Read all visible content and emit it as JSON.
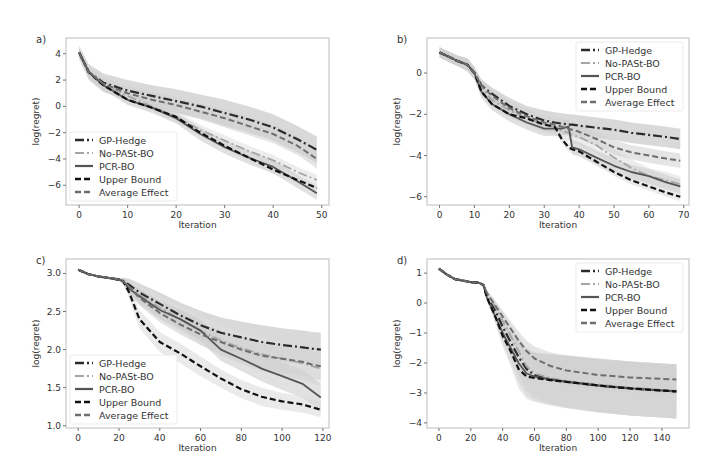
{
  "figure": {
    "background": "#ffffff",
    "frame_color": "#bdbdbd"
  },
  "series_styles": [
    {
      "name": "GP-Hedge",
      "color": "#2b2b2b",
      "dash": "9,3,2,3",
      "width": 2.2,
      "band": "#b9b9b9"
    },
    {
      "name": "No-PASt-BO",
      "color": "#a6a6a6",
      "dash": "9,3,2,3",
      "width": 1.8,
      "band": "#dedede"
    },
    {
      "name": "PCR-BO",
      "color": "#555555",
      "dash": "",
      "width": 1.8,
      "band": "#c8c8c8"
    },
    {
      "name": "Upper Bound",
      "color": "#111111",
      "dash": "6,3",
      "width": 2.2,
      "band": "#d9d9d9"
    },
    {
      "name": "Average Effect",
      "color": "#6e6e6e",
      "dash": "6,3",
      "width": 2.0,
      "band": "#cfcfcf"
    }
  ],
  "chart_data": [
    {
      "panel_label": "a)",
      "type": "line",
      "title": "",
      "xlabel": "Iteration",
      "ylabel": "log(regret)",
      "xlim": [
        -2.7,
        51.5
      ],
      "ylim": [
        -7.5,
        5.2
      ],
      "xticks": [
        0,
        10,
        20,
        30,
        40,
        50
      ],
      "yticks": [
        4,
        2,
        0,
        -2,
        -4,
        -6
      ],
      "grid": false,
      "legend_position": "lower left",
      "box": {
        "x": 66,
        "y": 38,
        "w": 263,
        "h": 167
      },
      "x": [
        0,
        2,
        5,
        10,
        15,
        20,
        25,
        30,
        35,
        40,
        45,
        49
      ],
      "series": [
        {
          "name": "GP-Hedge",
          "values": [
            4.1,
            2.6,
            1.8,
            1.2,
            0.8,
            0.4,
            0.0,
            -0.5,
            -1.0,
            -1.6,
            -2.5,
            -3.3
          ],
          "band": [
            0.5,
            0.6,
            0.7,
            0.8,
            0.8,
            0.9,
            0.9,
            1.0,
            1.0,
            1.0,
            1.0,
            1.0
          ]
        },
        {
          "name": "No-PASt-BO",
          "values": [
            4.1,
            2.6,
            1.7,
            0.8,
            0.0,
            -0.8,
            -1.8,
            -2.6,
            -3.4,
            -4.1,
            -5.0,
            -5.6
          ],
          "band": [
            0.3,
            0.3,
            0.3,
            0.4,
            0.4,
            0.4,
            0.4,
            0.4,
            0.4,
            0.4,
            0.4,
            0.4
          ]
        },
        {
          "name": "PCR-BO",
          "values": [
            4.1,
            2.6,
            1.6,
            0.5,
            -0.1,
            -0.9,
            -2.1,
            -3.1,
            -3.9,
            -4.6,
            -5.7,
            -6.6
          ],
          "band": [
            0.3,
            0.3,
            0.3,
            0.4,
            0.4,
            0.4,
            0.5,
            0.5,
            0.5,
            0.5,
            0.5,
            0.5
          ]
        },
        {
          "name": "Upper Bound",
          "values": [
            4.1,
            2.6,
            1.6,
            0.5,
            -0.1,
            -0.8,
            -2.0,
            -3.0,
            -3.9,
            -4.8,
            -5.6,
            -6.2
          ],
          "band": [
            0.2,
            0.2,
            0.3,
            0.3,
            0.3,
            0.3,
            0.3,
            0.3,
            0.3,
            0.3,
            0.3,
            0.3
          ]
        },
        {
          "name": "Average Effect",
          "values": [
            4.1,
            2.6,
            1.7,
            1.0,
            0.5,
            0.1,
            -0.4,
            -0.9,
            -1.5,
            -2.1,
            -3.0,
            -4.0
          ],
          "band": [
            0.3,
            0.4,
            0.5,
            0.5,
            0.6,
            0.6,
            0.6,
            0.7,
            0.7,
            0.7,
            0.7,
            0.7
          ]
        }
      ]
    },
    {
      "panel_label": "b)",
      "type": "line",
      "title": "",
      "xlabel": "Iteration",
      "ylabel": "log(regret)",
      "xlim": [
        -3.6,
        71.5
      ],
      "ylim": [
        -6.4,
        1.7
      ],
      "xticks": [
        0,
        10,
        20,
        30,
        40,
        50,
        60,
        70
      ],
      "yticks": [
        0,
        -2,
        -4,
        -6
      ],
      "grid": false,
      "legend_position": "upper right",
      "box": {
        "x": 427,
        "y": 38,
        "w": 262,
        "h": 167
      },
      "x": [
        0,
        5,
        8,
        10,
        12,
        15,
        20,
        25,
        30,
        33,
        35,
        37,
        38,
        40,
        45,
        50,
        55,
        60,
        65,
        69
      ],
      "series": [
        {
          "name": "GP-Hedge",
          "values": [
            1.0,
            0.6,
            0.4,
            0.0,
            -0.6,
            -1.0,
            -1.6,
            -2.0,
            -2.3,
            -2.4,
            -2.45,
            -2.5,
            -2.5,
            -2.55,
            -2.65,
            -2.75,
            -2.9,
            -3.0,
            -3.1,
            -3.2
          ],
          "band": [
            0.25,
            0.25,
            0.3,
            0.3,
            0.3,
            0.3,
            0.4,
            0.4,
            0.5,
            0.5,
            0.5,
            0.5,
            0.5,
            0.5,
            0.5,
            0.5,
            0.5,
            0.5,
            0.5,
            0.5
          ]
        },
        {
          "name": "No-PASt-BO",
          "values": [
            1.0,
            0.6,
            0.4,
            0.0,
            -0.7,
            -1.3,
            -1.8,
            -2.2,
            -2.5,
            -2.6,
            -2.8,
            -2.9,
            -3.0,
            -3.1,
            -3.5,
            -4.1,
            -4.6,
            -5.0,
            -5.2,
            -5.4
          ],
          "band": [
            0.25,
            0.25,
            0.3,
            0.3,
            0.3,
            0.3,
            0.35,
            0.35,
            0.4,
            0.4,
            0.4,
            0.4,
            0.4,
            0.4,
            0.4,
            0.4,
            0.4,
            0.4,
            0.4,
            0.4
          ]
        },
        {
          "name": "PCR-BO",
          "values": [
            1.0,
            0.6,
            0.4,
            0.0,
            -0.9,
            -1.5,
            -2.0,
            -2.4,
            -2.7,
            -2.7,
            -2.7,
            -2.6,
            -3.6,
            -3.7,
            -4.1,
            -4.5,
            -4.8,
            -5.0,
            -5.3,
            -5.5
          ],
          "band": [
            0.25,
            0.25,
            0.3,
            0.3,
            0.3,
            0.3,
            0.35,
            0.35,
            0.35,
            0.35,
            0.35,
            0.35,
            0.35,
            0.35,
            0.35,
            0.35,
            0.35,
            0.35,
            0.35,
            0.35
          ]
        },
        {
          "name": "Upper Bound",
          "values": [
            1.0,
            0.6,
            0.4,
            0.0,
            -0.9,
            -1.5,
            -2.0,
            -2.2,
            -2.5,
            -2.6,
            -3.2,
            -3.6,
            -3.7,
            -3.8,
            -4.3,
            -4.8,
            -5.2,
            -5.5,
            -5.8,
            -6.0
          ],
          "band": [
            0.2,
            0.2,
            0.2,
            0.2,
            0.2,
            0.2,
            0.2,
            0.2,
            0.2,
            0.2,
            0.2,
            0.2,
            0.2,
            0.2,
            0.2,
            0.2,
            0.2,
            0.2,
            0.2,
            0.2
          ]
        },
        {
          "name": "Average Effect",
          "values": [
            1.0,
            0.6,
            0.4,
            0.0,
            -0.6,
            -1.1,
            -1.7,
            -2.1,
            -2.4,
            -2.5,
            -2.6,
            -2.7,
            -2.75,
            -2.85,
            -3.2,
            -3.6,
            -3.85,
            -4.0,
            -4.15,
            -4.25
          ],
          "band": [
            0.25,
            0.25,
            0.3,
            0.3,
            0.3,
            0.3,
            0.35,
            0.35,
            0.35,
            0.35,
            0.35,
            0.35,
            0.35,
            0.35,
            0.35,
            0.35,
            0.35,
            0.35,
            0.35,
            0.35
          ]
        }
      ]
    },
    {
      "panel_label": "c)",
      "type": "line",
      "title": "",
      "xlabel": "Iteration",
      "ylabel": "log(regret)",
      "xlim": [
        -6,
        123
      ],
      "ylim": [
        0.97,
        3.19
      ],
      "xticks": [
        0,
        20,
        40,
        60,
        80,
        100,
        120
      ],
      "yticks": [
        3.0,
        2.5,
        2.0,
        1.5,
        1.0
      ],
      "grid": false,
      "legend_position": "lower left",
      "box": {
        "x": 66,
        "y": 259,
        "w": 263,
        "h": 169
      },
      "x": [
        0,
        5,
        10,
        15,
        20,
        22,
        25,
        30,
        40,
        50,
        60,
        70,
        80,
        90,
        100,
        110,
        115,
        119
      ],
      "series": [
        {
          "name": "GP-Hedge",
          "values": [
            3.05,
            2.99,
            2.96,
            2.94,
            2.92,
            2.9,
            2.85,
            2.75,
            2.6,
            2.45,
            2.32,
            2.22,
            2.16,
            2.1,
            2.06,
            2.03,
            2.01,
            2.0
          ],
          "band": [
            0.01,
            0.01,
            0.01,
            0.01,
            0.02,
            0.04,
            0.08,
            0.12,
            0.15,
            0.17,
            0.19,
            0.2,
            0.21,
            0.22,
            0.22,
            0.22,
            0.22,
            0.22
          ]
        },
        {
          "name": "No-PASt-BO",
          "values": [
            3.05,
            2.99,
            2.96,
            2.94,
            2.92,
            2.9,
            2.82,
            2.72,
            2.55,
            2.4,
            2.25,
            2.12,
            2.02,
            1.94,
            1.88,
            1.82,
            1.78,
            1.75
          ],
          "band": [
            0.01,
            0.01,
            0.01,
            0.01,
            0.02,
            0.04,
            0.08,
            0.12,
            0.15,
            0.17,
            0.19,
            0.2,
            0.21,
            0.22,
            0.22,
            0.22,
            0.22,
            0.22
          ]
        },
        {
          "name": "PCR-BO",
          "values": [
            3.05,
            2.99,
            2.96,
            2.94,
            2.92,
            2.9,
            2.8,
            2.7,
            2.52,
            2.4,
            2.25,
            2.0,
            1.88,
            1.75,
            1.65,
            1.55,
            1.45,
            1.37
          ],
          "band": [
            0.01,
            0.01,
            0.01,
            0.01,
            0.02,
            0.04,
            0.08,
            0.1,
            0.12,
            0.13,
            0.14,
            0.15,
            0.16,
            0.17,
            0.18,
            0.18,
            0.18,
            0.18
          ]
        },
        {
          "name": "Upper Bound",
          "values": [
            3.05,
            2.99,
            2.96,
            2.94,
            2.92,
            2.9,
            2.75,
            2.4,
            2.1,
            1.95,
            1.78,
            1.62,
            1.48,
            1.38,
            1.32,
            1.28,
            1.24,
            1.21
          ],
          "band": [
            0.01,
            0.01,
            0.01,
            0.01,
            0.02,
            0.04,
            0.08,
            0.12,
            0.13,
            0.13,
            0.13,
            0.12,
            0.12,
            0.12,
            0.11,
            0.11,
            0.1,
            0.1
          ]
        },
        {
          "name": "Average Effect",
          "values": [
            3.05,
            2.99,
            2.96,
            2.94,
            2.92,
            2.9,
            2.82,
            2.68,
            2.48,
            2.33,
            2.2,
            2.1,
            2.0,
            1.92,
            1.88,
            1.84,
            1.8,
            1.78
          ],
          "band": [
            0.01,
            0.01,
            0.01,
            0.01,
            0.02,
            0.04,
            0.08,
            0.1,
            0.12,
            0.13,
            0.14,
            0.15,
            0.16,
            0.17,
            0.18,
            0.18,
            0.18,
            0.18
          ]
        }
      ]
    },
    {
      "panel_label": "d)",
      "type": "line",
      "title": "",
      "xlabel": "Iteration",
      "ylabel": "log(regret)",
      "xlim": [
        -7.5,
        157
      ],
      "ylim": [
        -4.17,
        1.47
      ],
      "xticks": [
        0,
        20,
        40,
        60,
        80,
        100,
        120,
        140
      ],
      "yticks": [
        1,
        0,
        -1,
        -2,
        -3,
        -4
      ],
      "grid": false,
      "legend_position": "upper right",
      "box": {
        "x": 427,
        "y": 259,
        "w": 262,
        "h": 169
      },
      "x": [
        0,
        5,
        10,
        20,
        25,
        28,
        30,
        35,
        40,
        45,
        50,
        55,
        60,
        70,
        80,
        100,
        120,
        140,
        149
      ],
      "series": [
        {
          "name": "GP-Hedge",
          "values": [
            1.15,
            0.95,
            0.8,
            0.7,
            0.68,
            0.6,
            0.3,
            -0.2,
            -0.8,
            -1.3,
            -1.8,
            -2.2,
            -2.4,
            -2.55,
            -2.62,
            -2.75,
            -2.85,
            -2.92,
            -2.95
          ],
          "band": [
            0.02,
            0.02,
            0.03,
            0.03,
            0.03,
            0.05,
            0.1,
            0.2,
            0.3,
            0.45,
            0.6,
            0.7,
            0.75,
            0.8,
            0.85,
            0.88,
            0.9,
            0.9,
            0.9
          ]
        },
        {
          "name": "No-PASt-BO",
          "values": [
            1.15,
            0.95,
            0.8,
            0.7,
            0.68,
            0.6,
            0.3,
            -0.1,
            -0.6,
            -1.1,
            -1.6,
            -2.1,
            -2.35,
            -2.5,
            -2.6,
            -2.72,
            -2.82,
            -2.9,
            -2.93
          ],
          "band": [
            0.02,
            0.02,
            0.03,
            0.03,
            0.03,
            0.05,
            0.1,
            0.2,
            0.3,
            0.4,
            0.5,
            0.55,
            0.6,
            0.65,
            0.7,
            0.72,
            0.75,
            0.75,
            0.75
          ]
        },
        {
          "name": "PCR-BO",
          "values": [
            1.15,
            0.95,
            0.8,
            0.7,
            0.68,
            0.6,
            0.2,
            -0.4,
            -1.0,
            -1.5,
            -2.0,
            -2.35,
            -2.45,
            -2.55,
            -2.62,
            -2.75,
            -2.85,
            -2.92,
            -2.95
          ],
          "band": [
            0.02,
            0.02,
            0.03,
            0.03,
            0.03,
            0.05,
            0.1,
            0.2,
            0.35,
            0.5,
            0.65,
            0.75,
            0.8,
            0.85,
            0.88,
            0.9,
            0.9,
            0.9,
            0.9
          ]
        },
        {
          "name": "Upper Bound",
          "values": [
            1.15,
            0.95,
            0.8,
            0.7,
            0.68,
            0.6,
            0.2,
            -0.4,
            -1.1,
            -1.6,
            -2.2,
            -2.45,
            -2.5,
            -2.57,
            -2.63,
            -2.75,
            -2.85,
            -2.92,
            -2.95
          ],
          "band": [
            0.02,
            0.02,
            0.03,
            0.03,
            0.03,
            0.05,
            0.1,
            0.2,
            0.35,
            0.5,
            0.65,
            0.75,
            0.8,
            0.85,
            0.88,
            0.9,
            0.9,
            0.9,
            0.9
          ]
        },
        {
          "name": "Average Effect",
          "values": [
            1.15,
            0.95,
            0.8,
            0.7,
            0.68,
            0.6,
            0.35,
            -0.05,
            -0.45,
            -0.85,
            -1.25,
            -1.6,
            -1.85,
            -2.1,
            -2.25,
            -2.4,
            -2.48,
            -2.53,
            -2.55
          ],
          "band": [
            0.02,
            0.02,
            0.03,
            0.03,
            0.03,
            0.05,
            0.1,
            0.15,
            0.2,
            0.25,
            0.3,
            0.35,
            0.4,
            0.45,
            0.5,
            0.5,
            0.5,
            0.5,
            0.5
          ]
        }
      ]
    }
  ]
}
